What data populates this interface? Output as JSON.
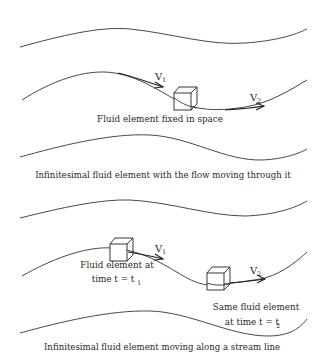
{
  "panels": [
    {
      "id": "fixed",
      "v1_label": "V",
      "v1_sub": "1",
      "v2_label": "V",
      "v2_sub": "2",
      "element_label": "Fluid element fixed in space",
      "caption": "Infinitesimal fluid element with the flow moving through it"
    },
    {
      "id": "moving",
      "v1_label": "V",
      "v1_sub": "1",
      "v2_label": "V",
      "v2_sub": "2",
      "element1_label_line1": "Fluid element at",
      "element1_label_line2": "time t = t",
      "element1_label_sub": "1",
      "element2_label_line1": "Same fluid element",
      "element2_label_line2": "at time t = t",
      "element2_label_sub": "2",
      "caption": "Infinitesimal fluid element moving along a stream line"
    }
  ],
  "colors": {
    "line": "#333333",
    "text": "#2a2a2a",
    "background": "#ffffff"
  }
}
